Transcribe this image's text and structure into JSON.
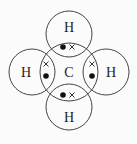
{
  "diagram": {
    "type": "dot-and-cross",
    "molecule": "methane",
    "central_atom": {
      "label": "C",
      "cx": 69,
      "cy": 72,
      "r": 29
    },
    "outer_atoms": [
      {
        "id": "top",
        "label": "H",
        "cx": 69,
        "cy": 34,
        "r": 23
      },
      {
        "id": "left",
        "label": "H",
        "cx": 32,
        "cy": 72,
        "r": 23
      },
      {
        "id": "right",
        "label": "H",
        "cx": 106,
        "cy": 72,
        "r": 23
      },
      {
        "id": "bottom",
        "label": "H",
        "cx": 69,
        "cy": 107,
        "r": 23
      }
    ],
    "bonding_pairs": [
      {
        "position": "top",
        "dot": [
          63,
          47
        ],
        "cross": [
          72,
          47
        ]
      },
      {
        "position": "left",
        "cross": [
          46,
          64
        ],
        "dot": [
          46,
          76
        ]
      },
      {
        "position": "right",
        "cross": [
          92,
          64
        ],
        "dot": [
          92,
          76
        ]
      },
      {
        "position": "bottom",
        "dot": [
          64,
          95
        ],
        "cross": [
          72,
          95
        ]
      }
    ],
    "colors": {
      "stroke": "#444444",
      "dot": "#111111",
      "background": "#fbfbfb"
    }
  }
}
